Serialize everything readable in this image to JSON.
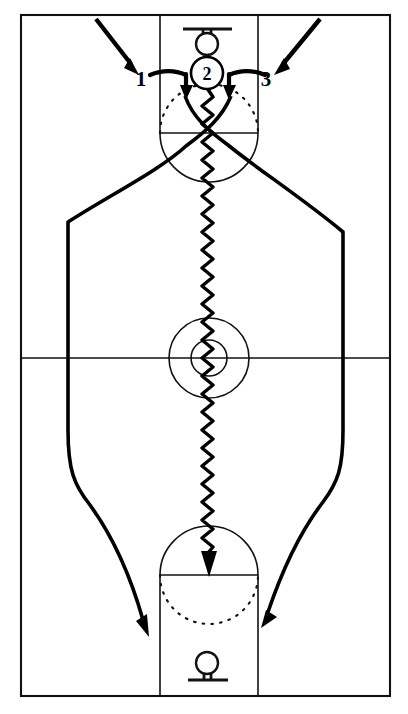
{
  "diagram": {
    "kind": "basketball-play",
    "background_color": "#ffffff",
    "line_color": "#111111",
    "action_color": "#000000"
  },
  "court": {
    "name": "full-court",
    "border": {
      "x": 21,
      "y": 15,
      "width": 369,
      "height": 681
    },
    "midcourt_line_y": 358,
    "center_circle": {
      "cx": 209,
      "cy": 358,
      "r": 40
    },
    "center_inner_circle": {
      "cx": 209,
      "cy": 358,
      "r": 18
    },
    "top_key": {
      "x": 160,
      "y": 15,
      "width": 98,
      "height": 118,
      "free_throw_line_y": 133
    },
    "bottom_key": {
      "x": 160,
      "y": 575,
      "width": 98,
      "height": 121,
      "free_throw_line_y": 575
    },
    "top_hoop": {
      "cx": 207,
      "cy": 40,
      "r": 11
    },
    "bottom_hoop": {
      "cx": 207,
      "cy": 666,
      "r": 11
    }
  },
  "markers": [
    {
      "id": "player-2",
      "label": "2",
      "role": "ball-handler",
      "cx": 207,
      "cy": 73,
      "r": 16
    }
  ],
  "labels": [
    {
      "id": "label-1",
      "text": "1",
      "x": 141,
      "y": 79,
      "role": "cutter-left"
    },
    {
      "id": "label-3",
      "text": "3",
      "x": 262,
      "y": 79,
      "role": "cutter-right"
    }
  ],
  "actions": {
    "entry_arrow_left": {
      "name": "entry-arrow-1",
      "description": "Player 1 enters from upper left toward the wing",
      "from": [
        96,
        18
      ],
      "to": [
        138,
        72
      ]
    },
    "entry_arrow_right": {
      "name": "entry-arrow-3",
      "description": "Player 3 enters from upper right toward the wing",
      "from": [
        320,
        18
      ],
      "to": [
        268,
        72
      ]
    },
    "screen_left": {
      "name": "screen-left-elbow",
      "description": "Screen set at the left elbow near player 2"
    },
    "screen_right": {
      "name": "screen-right-elbow",
      "description": "Screen set at the right elbow near player 2"
    },
    "cut_left": {
      "name": "cut-path-left",
      "description": "Left cutter path down the left side to the opposite baseline",
      "arrow_tip": [
        148,
        635
      ]
    },
    "cut_right": {
      "name": "cut-path-right",
      "description": "Right cutter path down the right side to the opposite baseline",
      "arrow_tip": [
        262,
        624
      ]
    },
    "dribble": {
      "name": "dribble-path",
      "description": "Ball handler dribbles from the top of the key through center court to the far free-throw line",
      "start": [
        207,
        88
      ],
      "arrow_tip": [
        209,
        572
      ],
      "style": "wavy"
    }
  }
}
